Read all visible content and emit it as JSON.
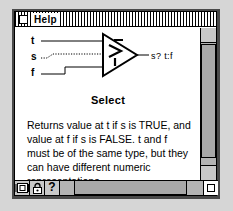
{
  "window": {
    "title": "Help",
    "close_box": "close-box"
  },
  "diagram": {
    "inputs": [
      {
        "name": "t",
        "label": "t",
        "wire": "solid"
      },
      {
        "name": "s",
        "label": "s",
        "wire": "dotted"
      },
      {
        "name": "f",
        "label": "f",
        "wire": "solid"
      }
    ],
    "node_icon": "select-triangle-icon",
    "output_label": "s? t:f"
  },
  "help": {
    "heading": "Select",
    "body": "Returns value at t if s is TRUE, and value at f if s is FALSE. t and f must be of the same type, but they can have different numeric representations."
  },
  "toolbar": {
    "buttons": [
      {
        "name": "simple-diagram-toggle",
        "icon": "nested-squares-icon"
      },
      {
        "name": "lock-help-button",
        "icon": "lock-icon"
      },
      {
        "name": "online-help-button",
        "icon": "question-mark-icon",
        "glyph": "?"
      }
    ]
  },
  "scrollbars": {
    "vertical_arrow_up": "▲",
    "vertical_arrow_down": "▼"
  },
  "colors": {
    "window_bg": "#ffffff",
    "desktop_bg": "#d6d6d6",
    "frame": "#000000",
    "scroll_track": "#b4b4b4",
    "scroll_thumb": "#a8a8a8",
    "button_face": "#c8c8c8"
  }
}
